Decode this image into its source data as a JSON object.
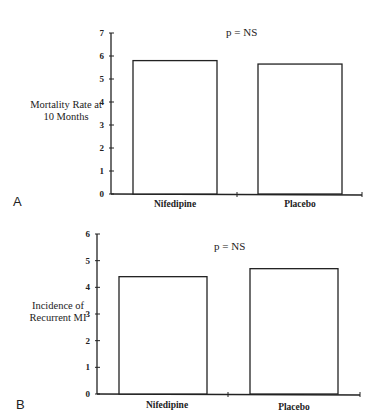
{
  "chart_data": [
    {
      "panel": "A",
      "type": "bar",
      "title": "",
      "annotation": "p = NS",
      "ylabel": "Mortality Rate at 10 Months",
      "ylabel_lines": [
        "Mortality Rate at",
        "10 Months"
      ],
      "xlabel": "",
      "categories": [
        "Nifedipine",
        "Placebo"
      ],
      "values": [
        5.8,
        5.65
      ],
      "ylim": [
        0,
        7
      ],
      "yticks": [
        0,
        1,
        2,
        3,
        4,
        5,
        6,
        7
      ],
      "grid": false,
      "legend": null
    },
    {
      "panel": "B",
      "type": "bar",
      "title": "",
      "annotation": "p = NS",
      "ylabel": "Incidence of Recurrent MI",
      "ylabel_lines": [
        "Incidence of",
        "Recurrent MI"
      ],
      "xlabel": "",
      "categories": [
        "Nifedipine",
        "Placebo"
      ],
      "values": [
        4.4,
        4.7
      ],
      "ylim": [
        0,
        6
      ],
      "yticks": [
        0,
        1,
        2,
        3,
        4,
        5,
        6
      ],
      "grid": false,
      "legend": null
    }
  ],
  "panels": {
    "a": {
      "letter": "A",
      "pval": "p = NS",
      "ylabel_line1": "Mortality Rate at",
      "ylabel_line2": "10 Months",
      "cat1": "Nifedipine",
      "cat2": "Placebo"
    },
    "b": {
      "letter": "B",
      "pval": "p = NS",
      "ylabel_line1": "Incidence of",
      "ylabel_line2": "Recurrent MI",
      "cat1": "Nifedipine",
      "cat2": "Placebo"
    }
  },
  "style": {
    "axis_color": "#222222",
    "bar_fill": "#ffffff",
    "bar_stroke": "#222222"
  }
}
